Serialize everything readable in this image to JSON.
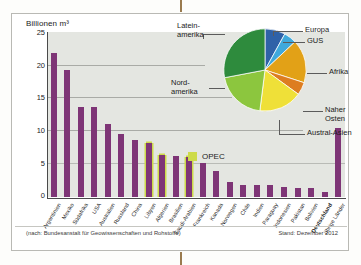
{
  "figure": {
    "axis_title": "Billionen m³",
    "source_note": "(nach: Bundesanstalt für Geowissenschaften und Rohstoffe)",
    "date_note": "Stand: Dezember 2012",
    "opec_legend_label": "OPEC",
    "colors": {
      "bar": "#7e3576",
      "opec_outline": "#cddb4a",
      "plot_background": "#e4e6e1",
      "europa": "#2f62a8",
      "gus": "#3fa9dc",
      "afrika": "#e2a117",
      "naher_osten": "#dd7d20",
      "austral_asien": "#efe038",
      "nordamerika": "#8cc63e",
      "lateinamerika": "#2e8b3d"
    }
  },
  "chart_data": [
    {
      "type": "bar",
      "title": "",
      "xlabel": "",
      "ylabel": "Billionen m³",
      "ylim": [
        0,
        25
      ],
      "yticks": [
        0,
        5,
        10,
        15,
        20,
        25
      ],
      "grid": true,
      "categories": [
        "Argentinien",
        "Mexiko",
        "Südafrika",
        "USA",
        "Australien",
        "Russland",
        "China",
        "Libyen",
        "Algerien",
        "Brasilien",
        "Saudi-Arabien",
        "Frankreich",
        "Kanada",
        "Norwegen",
        "Chile",
        "Indien",
        "Paraguay",
        "Indonesien",
        "Pakistan",
        "Bolivien",
        "Deutschland",
        "übrige Länder"
      ],
      "values": [
        21.8,
        19.2,
        13.7,
        13.7,
        11.1,
        9.5,
        8.6,
        8.2,
        6.4,
        6.2,
        6.0,
        5.1,
        3.9,
        2.3,
        1.8,
        1.8,
        1.8,
        1.5,
        1.4,
        1.4,
        0.8,
        10.5
      ],
      "opec_members": [
        "Libyen",
        "Algerien",
        "Saudi-Arabien"
      ],
      "bold_categories": [
        "Deutschland"
      ]
    },
    {
      "type": "pie",
      "title": "",
      "legend_position": "callout-labels",
      "labels": [
        "Europa",
        "GUS",
        "Afrika",
        "Naher Osten",
        "Austral-Asien",
        "Nordamerika",
        "Lateinamerika"
      ],
      "values": [
        8,
        5,
        17,
        5,
        17,
        20,
        28
      ]
    }
  ],
  "pie_labels": {
    "lateinamerika_line1": "Latein-",
    "lateinamerika_line2": "amerika",
    "nordamerika_line1": "Nord-",
    "nordamerika_line2": "amerika",
    "europa": "Europa",
    "gus": "GUS",
    "afrika": "Afrika",
    "naher_osten_line1": "Naher",
    "naher_osten_line2": "Osten",
    "austral_asien": "Austral-Asien"
  },
  "yticks": {
    "t0": "0",
    "t5": "5",
    "t10": "10",
    "t15": "15",
    "t20": "20",
    "t25": "25"
  }
}
